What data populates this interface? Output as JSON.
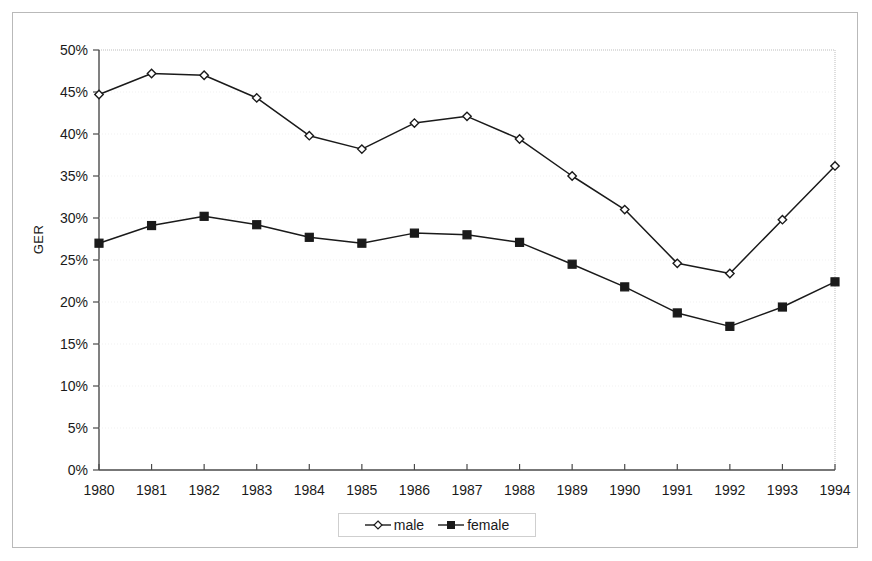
{
  "chart_data": {
    "type": "line",
    "title": "",
    "xlabel": "",
    "ylabel": "GER",
    "x": [
      1980,
      1981,
      1982,
      1983,
      1984,
      1985,
      1986,
      1987,
      1988,
      1989,
      1990,
      1991,
      1992,
      1993,
      1994
    ],
    "categories": [
      "1980",
      "1981",
      "1982",
      "1983",
      "1984",
      "1985",
      "1986",
      "1987",
      "1988",
      "1989",
      "1990",
      "1991",
      "1992",
      "1993",
      "1994"
    ],
    "series": [
      {
        "name": "male",
        "marker": "open-diamond",
        "color": "#1a1a1a",
        "values": [
          44.7,
          47.2,
          47.0,
          44.3,
          39.8,
          38.2,
          41.3,
          42.1,
          39.4,
          35.0,
          31.0,
          24.6,
          23.4,
          29.8,
          36.2
        ]
      },
      {
        "name": "female",
        "marker": "filled-square",
        "color": "#1a1a1a",
        "values": [
          27.0,
          29.1,
          30.2,
          29.2,
          27.7,
          27.0,
          28.2,
          28.0,
          27.1,
          24.5,
          21.8,
          18.7,
          17.1,
          19.4,
          22.4
        ]
      }
    ],
    "ylim": [
      0,
      50
    ],
    "ytick_values": [
      0,
      5,
      10,
      15,
      20,
      25,
      30,
      35,
      40,
      45,
      50
    ],
    "ytick_labels": [
      "0%",
      "5%",
      "10%",
      "15%",
      "20%",
      "25%",
      "30%",
      "35%",
      "40%",
      "45%",
      "50%"
    ],
    "grid": false,
    "legend_position": "bottom",
    "legend_entries": [
      "male",
      "female"
    ]
  },
  "axis": {
    "y_title": "GER"
  },
  "legend": {
    "male_label": "male",
    "female_label": "female"
  }
}
